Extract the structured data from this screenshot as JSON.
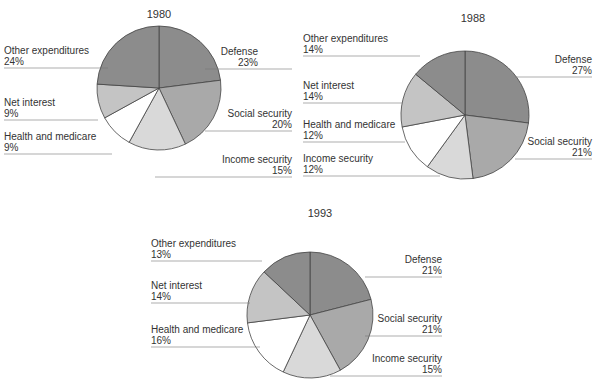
{
  "colors": {
    "Defense": "#8c8c8c",
    "Social security": "#a9a9a9",
    "Income security": "#d9d9d9",
    "Health and medicare": "#ffffff",
    "Net interest": "#c4c4c4",
    "Other expenditures": "#8c8c8c"
  },
  "chart_data": [
    {
      "type": "pie",
      "title": "1980",
      "categories": [
        "Defense",
        "Social security",
        "Income security",
        "Health and medicare",
        "Net interest",
        "Other expenditures"
      ],
      "values": [
        23,
        20,
        15,
        9,
        9,
        24
      ]
    },
    {
      "type": "pie",
      "title": "1988",
      "categories": [
        "Defense",
        "Social security",
        "Income security",
        "Health and medicare",
        "Net interest",
        "Other expenditures"
      ],
      "values": [
        27,
        21,
        12,
        12,
        14,
        14
      ]
    },
    {
      "type": "pie",
      "title": "1993",
      "categories": [
        "Defense",
        "Social security",
        "Income security",
        "Health and medicare",
        "Net interest",
        "Other expenditures"
      ],
      "values": [
        21,
        21,
        15,
        16,
        14,
        13
      ]
    }
  ],
  "layout": [
    {
      "cx": 159,
      "cy": 88,
      "r": 62,
      "tx": 159,
      "ty": 18,
      "labels": [
        {
          "side": "right",
          "x": 258,
          "y": 55,
          "x0": 205,
          "x1": 292
        },
        {
          "side": "right",
          "x": 292,
          "y": 117,
          "x0": 205,
          "x1": 292
        },
        {
          "side": "right",
          "x": 292,
          "y": 163,
          "x0": 155,
          "x1": 292
        },
        {
          "side": "left",
          "x": 4,
          "y": 140,
          "x0": 4,
          "x1": 112
        },
        {
          "side": "left",
          "x": 4,
          "y": 106,
          "x0": 4,
          "x1": 98
        },
        {
          "side": "left",
          "x": 4,
          "y": 54,
          "x0": 4,
          "x1": 108
        }
      ]
    },
    {
      "cx": 465,
      "cy": 115,
      "r": 64,
      "tx": 473,
      "ty": 22,
      "labels": [
        {
          "side": "right",
          "x": 592,
          "y": 63,
          "x0": 515,
          "x1": 592
        },
        {
          "side": "right",
          "x": 592,
          "y": 145,
          "x0": 515,
          "x1": 592
        },
        {
          "side": "left",
          "x": 303,
          "y": 162,
          "x0": 303,
          "x1": 440
        },
        {
          "side": "left",
          "x": 303,
          "y": 128,
          "x0": 303,
          "x1": 405
        },
        {
          "side": "left",
          "x": 303,
          "y": 89,
          "x0": 303,
          "x1": 402
        },
        {
          "side": "left",
          "x": 303,
          "y": 42,
          "x0": 303,
          "x1": 420
        }
      ]
    },
    {
      "cx": 310,
      "cy": 315,
      "r": 63,
      "tx": 320,
      "ty": 217,
      "labels": [
        {
          "side": "right",
          "x": 442,
          "y": 263,
          "x0": 365,
          "x1": 442
        },
        {
          "side": "right",
          "x": 442,
          "y": 322,
          "x0": 365,
          "x1": 442
        },
        {
          "side": "right",
          "x": 442,
          "y": 362,
          "x0": 330,
          "x1": 442
        },
        {
          "side": "left",
          "x": 151,
          "y": 333,
          "x0": 151,
          "x1": 260
        },
        {
          "side": "left",
          "x": 151,
          "y": 289,
          "x0": 151,
          "x1": 250
        },
        {
          "side": "left",
          "x": 151,
          "y": 247,
          "x0": 151,
          "x1": 262
        }
      ]
    }
  ]
}
